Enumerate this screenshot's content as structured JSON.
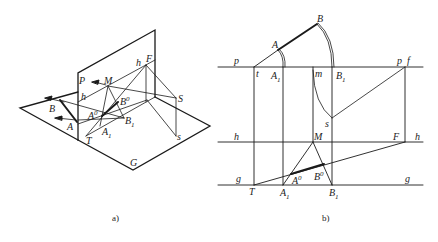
{
  "figure": {
    "panels": [
      {
        "id": "a",
        "caption": "a)",
        "type": "axonometric-view",
        "labels": {
          "P": "P",
          "h_left": "h",
          "h_top": "h",
          "M": "M",
          "F": "F",
          "B": "B",
          "B0": "B",
          "B0_sup": "0",
          "A0": "A",
          "A0_sup": "0",
          "A": "A",
          "A1": "A",
          "A1_sub": "1",
          "B1": "B",
          "B1_sub": "1",
          "T": "T",
          "S": "S",
          "s": "s",
          "G": "G"
        }
      },
      {
        "id": "b",
        "caption": "b)",
        "type": "orthographic-projection",
        "labels": {
          "p_left": "p",
          "p_right": "p",
          "f": "f",
          "t": "t",
          "A_top": "A",
          "B_top": "B",
          "A1_top": "A",
          "A1_top_sub": "1",
          "m": "m",
          "B1_top": "B",
          "B1_top_sub": "1",
          "s": "s",
          "h_left": "h",
          "h_right": "h",
          "M": "M",
          "F": "F",
          "g_left": "g",
          "g_right": "g",
          "T": "T",
          "A0": "A",
          "A0_sup": "0",
          "B0": "B",
          "B0_sup": "0",
          "A1_bot": "A",
          "A1_bot_sub": "1",
          "B1_bot": "B",
          "B1_bot_sub": "1"
        }
      }
    ],
    "colors": {
      "line": "#1a1a1a",
      "thin_line": "#333333",
      "background": "#ffffff"
    }
  }
}
